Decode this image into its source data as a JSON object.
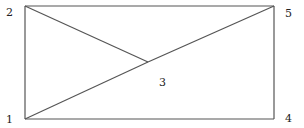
{
  "diagram": {
    "type": "graph",
    "stroke_color": "#555555",
    "label_color": "#222222",
    "background": "#ffffff",
    "nodes": [
      {
        "id": "1",
        "label": "1",
        "x": 25,
        "y": 119,
        "label_x": 6,
        "label_y": 123
      },
      {
        "id": "2",
        "label": "2",
        "x": 25,
        "y": 6,
        "label_x": 6,
        "label_y": 16
      },
      {
        "id": "3",
        "label": "3",
        "x": 148,
        "y": 62,
        "label_x": 159,
        "label_y": 86
      },
      {
        "id": "4",
        "label": "4",
        "x": 274,
        "y": 119,
        "label_x": 285,
        "label_y": 122
      },
      {
        "id": "5",
        "label": "5",
        "x": 274,
        "y": 6,
        "label_x": 285,
        "label_y": 17
      }
    ],
    "edges": [
      {
        "from": "2",
        "to": "5"
      },
      {
        "from": "5",
        "to": "4"
      },
      {
        "from": "4",
        "to": "1"
      },
      {
        "from": "1",
        "to": "2"
      },
      {
        "from": "2",
        "to": "3"
      },
      {
        "from": "1",
        "to": "3"
      },
      {
        "from": "3",
        "to": "5"
      }
    ]
  }
}
